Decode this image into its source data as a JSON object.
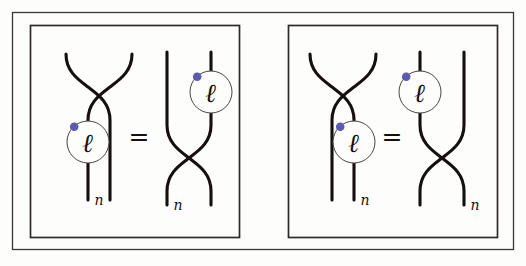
{
  "figure": {
    "background_color": "#fdfdfb",
    "strand_color": "#15100f",
    "bead_outline_color": "#4a4449",
    "bead_dot_color": "#5b5bb0",
    "frame_color": "#2e2a29"
  },
  "labels": {
    "ell": "ℓ",
    "n": "n",
    "equals": "="
  },
  "panels": [
    {
      "id": "panel-left",
      "name": "left-relation-panel",
      "equals_sign": "=",
      "diagrams": [
        {
          "id": "left-panel-lhs",
          "name": "crossing-above-bead-left-strand",
          "crossing_position": "top",
          "bead": {
            "label": "ℓ",
            "dot_color": "#5b5bb0",
            "on_strand": "left",
            "below_crossing": true
          },
          "foot_label": "n",
          "foot_label_side": "left"
        },
        {
          "id": "left-panel-rhs",
          "name": "bead-right-strand-above-crossing",
          "crossing_position": "bottom",
          "bead": {
            "label": "ℓ",
            "dot_color": "#5b5bb0",
            "on_strand": "right",
            "below_crossing": false
          },
          "foot_label": "n",
          "foot_label_side": "left"
        }
      ]
    },
    {
      "id": "panel-right",
      "name": "right-relation-panel",
      "equals_sign": "=",
      "diagrams": [
        {
          "id": "right-panel-lhs",
          "name": "crossing-above-bead-right-strand",
          "crossing_position": "top",
          "bead": {
            "label": "ℓ",
            "dot_color": "#5b5bb0",
            "on_strand": "right",
            "below_crossing": true
          },
          "foot_label": "n",
          "foot_label_side": "right"
        },
        {
          "id": "right-panel-rhs",
          "name": "bead-left-strand-above-crossing",
          "crossing_position": "bottom",
          "bead": {
            "label": "ℓ",
            "dot_color": "#5b5bb0",
            "on_strand": "left",
            "below_crossing": false
          },
          "foot_label": "n",
          "foot_label_side": "right"
        }
      ]
    }
  ]
}
